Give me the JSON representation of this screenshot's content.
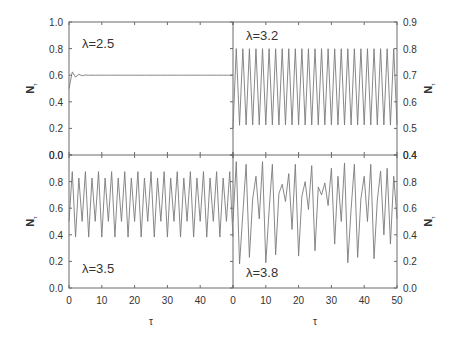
{
  "figure": {
    "x_label": "τ",
    "y_label": "N",
    "y_label_sub": "τ"
  },
  "chart_data": [
    {
      "type": "line",
      "panel": "top-left",
      "annotation": "λ=2.5",
      "xlabel": "",
      "ylabel": "Nτ",
      "xlim": [
        0,
        50
      ],
      "ylim": [
        0.0,
        1.0
      ],
      "yticks": [
        "0.0",
        "0.2",
        "0.4",
        "0.6",
        "0.8",
        "1.0"
      ],
      "xticks": [],
      "y_axis_side": "left",
      "x": [
        0,
        1,
        2,
        3,
        4,
        5,
        6,
        7,
        8,
        9,
        10,
        11,
        12,
        13,
        14,
        15,
        16,
        17,
        18,
        19,
        20,
        21,
        22,
        23,
        24,
        25,
        26,
        27,
        28,
        29,
        30,
        31,
        32,
        33,
        34,
        35,
        36,
        37,
        38,
        39,
        40,
        41,
        42,
        43,
        44,
        45,
        46,
        47,
        48,
        49,
        50
      ],
      "values": [
        0.5,
        0.625,
        0.5859,
        0.6065,
        0.5966,
        0.6017,
        0.5992,
        0.6004,
        0.5998,
        0.6001,
        0.6,
        0.6,
        0.6,
        0.6,
        0.6,
        0.6,
        0.6,
        0.6,
        0.6,
        0.6,
        0.6,
        0.6,
        0.6,
        0.6,
        0.6,
        0.6,
        0.6,
        0.6,
        0.6,
        0.6,
        0.6,
        0.6,
        0.6,
        0.6,
        0.6,
        0.6,
        0.6,
        0.6,
        0.6,
        0.6,
        0.6,
        0.6,
        0.6,
        0.6,
        0.6,
        0.6,
        0.6,
        0.6,
        0.6,
        0.6,
        0.6
      ]
    },
    {
      "type": "line",
      "panel": "top-right",
      "annotation": "λ=3.2",
      "xlabel": "",
      "ylabel": "Nτ",
      "xlim": [
        0,
        50
      ],
      "ylim": [
        0.4,
        0.9
      ],
      "yticks": [
        "0.4",
        "0.5",
        "0.6",
        "0.7",
        "0.8",
        "0.9"
      ],
      "xticks": [],
      "y_axis_side": "right",
      "x": [
        0,
        1,
        2,
        3,
        4,
        5,
        6,
        7,
        8,
        9,
        10,
        11,
        12,
        13,
        14,
        15,
        16,
        17,
        18,
        19,
        20,
        21,
        22,
        23,
        24,
        25,
        26,
        27,
        28,
        29,
        30,
        31,
        32,
        33,
        34,
        35,
        36,
        37,
        38,
        39,
        40,
        41,
        42,
        43,
        44,
        45,
        46,
        47,
        48,
        49,
        50
      ],
      "values": [
        0.5,
        0.8,
        0.512,
        0.7995,
        0.513,
        0.7995,
        0.513,
        0.7995,
        0.513,
        0.7995,
        0.513,
        0.7995,
        0.513,
        0.7995,
        0.513,
        0.7995,
        0.513,
        0.7995,
        0.513,
        0.7995,
        0.513,
        0.7995,
        0.513,
        0.7995,
        0.513,
        0.7995,
        0.513,
        0.7995,
        0.513,
        0.7995,
        0.513,
        0.7995,
        0.513,
        0.7995,
        0.513,
        0.7995,
        0.513,
        0.7995,
        0.513,
        0.7995,
        0.513,
        0.7995,
        0.513,
        0.7995,
        0.513,
        0.7995,
        0.513,
        0.7995,
        0.513,
        0.7995,
        0.513
      ]
    },
    {
      "type": "line",
      "panel": "bottom-left",
      "annotation": "λ=3.5",
      "xlabel": "τ",
      "ylabel": "Nτ",
      "xlim": [
        0,
        50
      ],
      "ylim": [
        0.0,
        1.0
      ],
      "yticks": [
        "0.0",
        "0.2",
        "0.4",
        "0.6",
        "0.8",
        "0.0"
      ],
      "xticks": [
        "0",
        "10",
        "20",
        "30",
        "40"
      ],
      "y_axis_side": "left",
      "x": [
        0,
        1,
        2,
        3,
        4,
        5,
        6,
        7,
        8,
        9,
        10,
        11,
        12,
        13,
        14,
        15,
        16,
        17,
        18,
        19,
        20,
        21,
        22,
        23,
        24,
        25,
        26,
        27,
        28,
        29,
        30,
        31,
        32,
        33,
        34,
        35,
        36,
        37,
        38,
        39,
        40,
        41,
        42,
        43,
        44,
        45,
        46,
        47,
        48,
        49,
        50
      ],
      "values": [
        0.5,
        0.875,
        0.3828,
        0.8269,
        0.5009,
        0.875,
        0.3828,
        0.8269,
        0.5009,
        0.875,
        0.3828,
        0.8269,
        0.5009,
        0.875,
        0.3828,
        0.8269,
        0.5009,
        0.875,
        0.3828,
        0.8269,
        0.5009,
        0.875,
        0.3828,
        0.8269,
        0.5009,
        0.875,
        0.3828,
        0.8269,
        0.5009,
        0.875,
        0.3828,
        0.8269,
        0.5009,
        0.875,
        0.3828,
        0.8269,
        0.5009,
        0.875,
        0.3828,
        0.8269,
        0.5009,
        0.875,
        0.3828,
        0.8269,
        0.5009,
        0.875,
        0.3828,
        0.8269,
        0.5009,
        0.875,
        0.3828
      ]
    },
    {
      "type": "line",
      "panel": "bottom-right",
      "annotation": "λ=3.8",
      "xlabel": "τ",
      "ylabel": "Nτ",
      "xlim": [
        0,
        50
      ],
      "ylim": [
        0.0,
        1.0
      ],
      "yticks": [
        "0.0",
        "0.2",
        "0.4",
        "0.6",
        "0.8",
        "0.4"
      ],
      "xticks": [
        "0",
        "10",
        "20",
        "30",
        "40",
        "50"
      ],
      "y_axis_side": "right",
      "x": [
        0,
        1,
        2,
        3,
        4,
        5,
        6,
        7,
        8,
        9,
        10,
        11,
        12,
        13,
        14,
        15,
        16,
        17,
        18,
        19,
        20,
        21,
        22,
        23,
        24,
        25,
        26,
        27,
        28,
        29,
        30,
        31,
        32,
        33,
        34,
        35,
        36,
        37,
        38,
        39,
        40,
        41,
        42,
        43,
        44,
        45,
        46,
        47,
        48,
        49,
        50
      ],
      "values": [
        0.5,
        0.95,
        0.18,
        0.56,
        0.93,
        0.23,
        0.67,
        0.84,
        0.52,
        0.95,
        0.19,
        0.58,
        0.93,
        0.25,
        0.71,
        0.78,
        0.65,
        0.86,
        0.44,
        0.93,
        0.24,
        0.69,
        0.8,
        0.59,
        0.92,
        0.28,
        0.76,
        0.7,
        0.79,
        0.62,
        0.9,
        0.33,
        0.84,
        0.5,
        0.94,
        0.19,
        0.59,
        0.93,
        0.23,
        0.67,
        0.84,
        0.5,
        0.93,
        0.22,
        0.66,
        0.88,
        0.4,
        0.9,
        0.33,
        0.84,
        0.52
      ]
    }
  ]
}
